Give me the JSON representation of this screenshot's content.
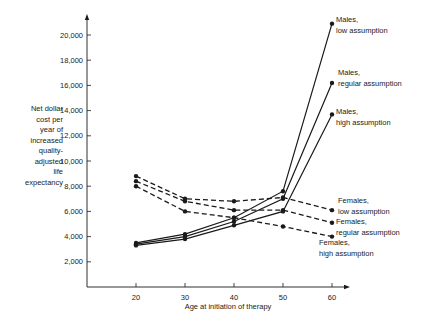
{
  "chart_data": {
    "type": "line",
    "title": "",
    "xlabel": "Age at initiation of therapy",
    "ylabel_lines": [
      "Net dollar",
      "cost per",
      "year of",
      "increased",
      "quality-",
      "adjusted",
      "life",
      "expectancy"
    ],
    "x": [
      20,
      30,
      40,
      50,
      60
    ],
    "x_ticks": [
      "20",
      "30",
      "40",
      "50",
      "60"
    ],
    "y_ticks": [
      "2,000",
      "4,000",
      "6,000",
      "8,000",
      "10,000",
      "12,000",
      "14,000",
      "16,000",
      "18,000",
      "20,000"
    ],
    "y_tick_values": [
      2000,
      4000,
      6000,
      8000,
      10000,
      12000,
      14000,
      16000,
      18000,
      20000
    ],
    "xlim": [
      12,
      63
    ],
    "ylim": [
      0,
      21500
    ],
    "grid": false,
    "legend": "inline-right",
    "series": [
      {
        "name": "Males, low assumption",
        "label_lines": [
          "Males,",
          "low assumption"
        ],
        "style": "solid",
        "values": [
          3500,
          4200,
          5500,
          7600,
          20900
        ]
      },
      {
        "name": "Males, regular assumption",
        "label_lines": [
          "Males,",
          "regular assumption"
        ],
        "style": "solid",
        "values": [
          3400,
          4000,
          5200,
          7000,
          16200
        ]
      },
      {
        "name": "Males, high assumption",
        "label_lines": [
          "Males,",
          "high assumption"
        ],
        "style": "solid",
        "values": [
          3300,
          3800,
          4900,
          6000,
          13700
        ]
      },
      {
        "name": "Females, low assumption",
        "label_lines": [
          "Females,",
          "low assumption"
        ],
        "style": "dashed",
        "values": [
          8800,
          7000,
          6800,
          7100,
          6100
        ]
      },
      {
        "name": "Females, regular assumption",
        "label_lines": [
          "Females,",
          "regular assumption"
        ],
        "style": "dashed",
        "values": [
          8400,
          6800,
          6100,
          6100,
          5100
        ]
      },
      {
        "name": "Females, high assumption",
        "label_lines": [
          "Females,",
          "high assumption"
        ],
        "style": "dashed",
        "values": [
          8000,
          6000,
          5500,
          4800,
          4000
        ]
      }
    ],
    "colors": {
      "ink": "#1a1a1a",
      "background": "#ffffff"
    }
  }
}
